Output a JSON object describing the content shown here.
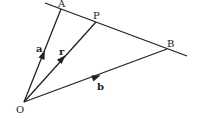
{
  "diagram": {
    "type": "vector-geometry",
    "background": "#ffffff",
    "stroke_color": "#222222",
    "points": {
      "O": {
        "label": "O",
        "x": 24,
        "y": 102,
        "label_x": 16,
        "label_y": 113
      },
      "A": {
        "label": "A",
        "x": 61,
        "y": 9,
        "label_x": 58,
        "label_y": 7
      },
      "P": {
        "label": "P",
        "x": 96,
        "y": 22,
        "label_x": 93,
        "label_y": 19
      },
      "B": {
        "label": "B",
        "x": 167,
        "y": 49,
        "label_x": 167,
        "label_y": 47
      }
    },
    "line_AB": {
      "x1": 45,
      "y1": 3,
      "x2": 187,
      "y2": 56
    },
    "vectors": [
      {
        "name": "a",
        "from": "O",
        "to": "A",
        "label": "a",
        "label_x": 36,
        "label_y": 52,
        "arrow_x": 43,
        "arrow_y": 55
      },
      {
        "name": "r",
        "from": "O",
        "to": "P",
        "label": "r",
        "label_x": 59,
        "label_y": 55,
        "arrow_x": 62,
        "arrow_y": 59
      },
      {
        "name": "b",
        "from": "O",
        "to": "B",
        "label": "b",
        "label_x": 97,
        "label_y": 90,
        "arrow_x": 96,
        "arrow_y": 77
      }
    ]
  }
}
